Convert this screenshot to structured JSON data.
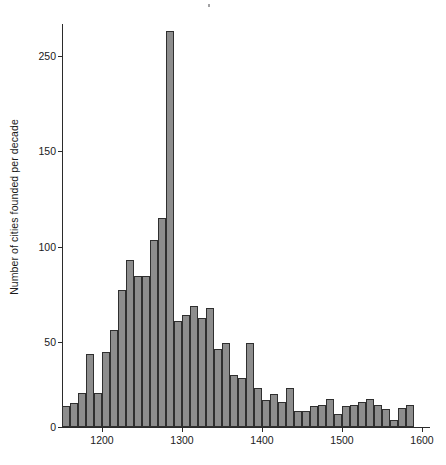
{
  "figure": {
    "width": 446,
    "height": 465,
    "background": "#ffffff",
    "bar_fill": "#8d8d8d",
    "bar_edge": "#2f2f2f",
    "axis_color": "#2b2b2b"
  },
  "axes": {
    "ylabel": "Number of cities founded per decade",
    "xlabel": "",
    "y_ticks": [
      0,
      50,
      100,
      150,
      250
    ],
    "y_tick_labels": [
      "0",
      "50",
      "100",
      "150",
      "250"
    ],
    "x_ticks": [
      1200,
      1300,
      1400,
      1500,
      1600
    ],
    "x_tick_labels": [
      "1200",
      "1300",
      "1400",
      "1500",
      "1600"
    ]
  },
  "chart_data": {
    "type": "bar",
    "title": "",
    "xlabel": "",
    "ylabel": "Number of cities founded per decade",
    "xlim": [
      1150,
      1610
    ],
    "ylim": [
      0,
      270
    ],
    "grid": false,
    "legend": null,
    "bin_width": 10,
    "bin_unit": "decade",
    "categories": [
      1150,
      1160,
      1170,
      1180,
      1190,
      1200,
      1210,
      1220,
      1230,
      1240,
      1250,
      1260,
      1270,
      1280,
      1290,
      1300,
      1310,
      1320,
      1330,
      1340,
      1350,
      1360,
      1370,
      1380,
      1390,
      1400,
      1410,
      1420,
      1430,
      1440,
      1450,
      1460,
      1470,
      1480,
      1490,
      1500,
      1510,
      1520,
      1530,
      1540,
      1550,
      1560,
      1570,
      1580,
      1590,
      1600
    ],
    "values": [
      14,
      16,
      23,
      49,
      23,
      50,
      65,
      92,
      112,
      101,
      101,
      125,
      140,
      265,
      71,
      75,
      81,
      73,
      80,
      52,
      56,
      35,
      33,
      56,
      26,
      18,
      22,
      17,
      26,
      11,
      11,
      14,
      15,
      19,
      9,
      14,
      15,
      17,
      19,
      15,
      12,
      5,
      13,
      15,
      0,
      0
    ]
  }
}
